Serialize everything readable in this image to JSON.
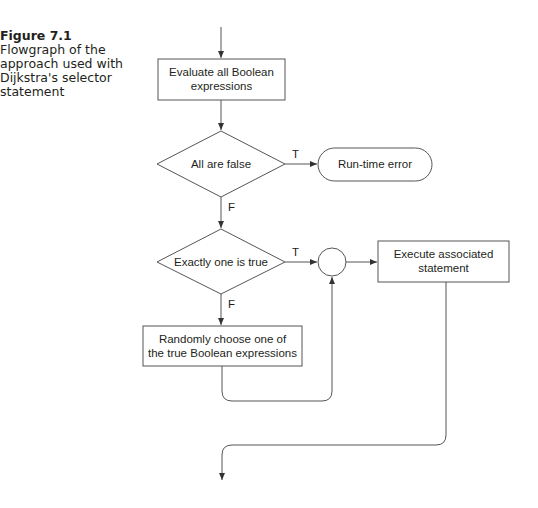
{
  "caption": {
    "figure_label": "Figure 7.1",
    "text": "Flowgraph of the approach used with Dijkstra's selector statement"
  },
  "nodes": {
    "evaluate": {
      "line1": "Evaluate all Boolean",
      "line2": "expressions"
    },
    "all_false": {
      "label": "All are false"
    },
    "runtime_error": {
      "label": "Run-time error"
    },
    "exactly_one": {
      "label": "Exactly one is true"
    },
    "random_choose": {
      "line1": "Randomly choose one of",
      "line2": "the true Boolean expressions"
    },
    "execute": {
      "line1": "Execute associated",
      "line2": "statement"
    }
  },
  "edge_labels": {
    "all_false_true": "T",
    "all_false_false": "F",
    "exactly_one_true": "T",
    "exactly_one_false": "F"
  },
  "colors": {
    "stroke": "#555555",
    "text": "#231f20"
  }
}
